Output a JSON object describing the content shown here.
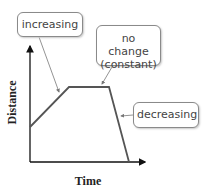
{
  "diagram": {
    "type": "distance-time graph",
    "x_axis_label": "Time",
    "y_axis_label": "Distance",
    "callouts": [
      {
        "id": "increasing",
        "text": "increasing"
      },
      {
        "id": "constant",
        "line1": "no change",
        "line2": "(constant)"
      },
      {
        "id": "decreasing",
        "text": "decreasing"
      }
    ],
    "segments": [
      {
        "name": "increasing",
        "from": [
          30,
          127
        ],
        "to": [
          69,
          87
        ]
      },
      {
        "name": "constant",
        "from": [
          69,
          87
        ],
        "to": [
          109,
          87
        ]
      },
      {
        "name": "decreasing",
        "from": [
          109,
          87
        ],
        "to": [
          129,
          162
        ]
      }
    ],
    "colors": {
      "graph_line": "#555555",
      "axis": "#111111",
      "callout_border": "#8a8a8a",
      "pointer": "#777777"
    }
  }
}
